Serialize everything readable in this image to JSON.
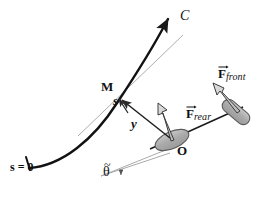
{
  "figure": {
    "background_color": "#ffffff",
    "width": 268,
    "height": 197,
    "colors": {
      "curve": "#111111",
      "tangent_line": "#9a9a9a",
      "vector_arrow": "#2b2b2b",
      "wheel_fill": "#b0b0b0",
      "wheel_stroke": "#4a4a4a",
      "force_arrow_fill": "#c9c9c9",
      "force_arrow_stroke": "#3a3a3a",
      "angle_line": "#9a9a9a",
      "text": "#111111"
    }
  },
  "labels": {
    "curve_name": "C",
    "point_m": "M",
    "arc_length": "s",
    "lateral_offset": "y",
    "arc_origin": "s = 0",
    "point_o": "O",
    "heading_angle": "θ",
    "heading_angle_accent": "~",
    "force_rear": {
      "symbol": "F",
      "subscript": "rear",
      "full": "F_rear"
    },
    "force_front": {
      "symbol": "F",
      "subscript": "front",
      "full": "F_front"
    }
  },
  "geometry": {
    "curve_path": "M 28,168 C 60,166 92,140 116,104 C 138,72 156,40 168,16",
    "curve_arrow_tip": [
      168,
      14
    ],
    "curve_start_tick": [
      28,
      168
    ],
    "tangent_line": [
      [
        78,
        135
      ],
      [
        182,
        36
      ]
    ],
    "point_m": [
      119,
      99
    ],
    "point_o": [
      172,
      141
    ],
    "y_arrow": [
      [
        171,
        140
      ],
      [
        120,
        98
      ]
    ],
    "s_arrow": [
      [
        125,
        110
      ],
      [
        118,
        97
      ]
    ],
    "chassis_line": [
      [
        152,
        148
      ],
      [
        236,
        110
      ]
    ],
    "rear_wheel": {
      "cx": 172,
      "cy": 140,
      "rx": 17,
      "ry": 8,
      "rotation_deg": -24
    },
    "front_wheel": {
      "cx": 237,
      "cy": 112,
      "w": 30,
      "h": 13,
      "rotation_deg": 42
    },
    "force_rear_arrow": [
      [
        172,
        139
      ],
      [
        159,
        109
      ]
    ],
    "force_front_arrow": [
      [
        238,
        110
      ],
      [
        215,
        84
      ]
    ],
    "angle_vertex": [
      103,
      176
    ],
    "angle_line_upper": [
      [
        103,
        176
      ],
      [
        176,
        146
      ]
    ],
    "angle_line_lower": [
      [
        103,
        176
      ],
      [
        163,
        161
      ]
    ],
    "angle_arc_radius": 18
  }
}
